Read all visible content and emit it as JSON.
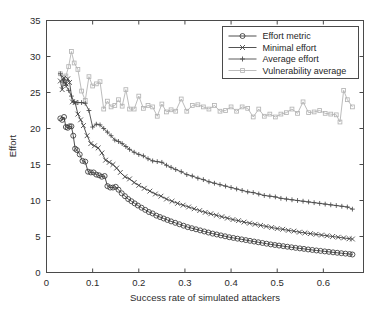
{
  "chart_data": {
    "type": "line",
    "title": "",
    "xlabel": "Success rate of simulated attackers",
    "ylabel": "Effort",
    "xlim": [
      0,
      0.687
    ],
    "ylim": [
      0,
      35
    ],
    "grid": false,
    "legend_position": "top-right",
    "xticks": [
      0,
      0.1,
      0.2,
      0.3,
      0.4,
      0.5,
      0.6
    ],
    "xtick_labels": [
      "0",
      "0.1",
      "0.2",
      "0.3",
      "0.4",
      "0.5",
      "0.6"
    ],
    "yticks": [
      0,
      5,
      10,
      15,
      20,
      25,
      30,
      35
    ],
    "ytick_labels": [
      "0",
      "5",
      "10",
      "15",
      "20",
      "25",
      "30",
      "35"
    ],
    "series": [
      {
        "name": "Effort metric",
        "marker": "circle",
        "color": "#3a3a3a",
        "x": [
          0.03,
          0.034,
          0.038,
          0.042,
          0.046,
          0.05,
          0.054,
          0.058,
          0.062,
          0.066,
          0.072,
          0.078,
          0.084,
          0.09,
          0.096,
          0.102,
          0.108,
          0.114,
          0.12,
          0.126,
          0.132,
          0.138,
          0.144,
          0.15,
          0.156,
          0.163,
          0.17,
          0.177,
          0.184,
          0.191,
          0.198,
          0.206,
          0.214,
          0.222,
          0.23,
          0.238,
          0.246,
          0.254,
          0.262,
          0.27,
          0.279,
          0.288,
          0.297,
          0.306,
          0.315,
          0.324,
          0.333,
          0.342,
          0.351,
          0.36,
          0.369,
          0.378,
          0.387,
          0.396,
          0.405,
          0.414,
          0.423,
          0.432,
          0.441,
          0.45,
          0.459,
          0.468,
          0.477,
          0.486,
          0.495,
          0.504,
          0.513,
          0.522,
          0.531,
          0.54,
          0.549,
          0.558,
          0.567,
          0.576,
          0.585,
          0.594,
          0.603,
          0.612,
          0.621,
          0.63,
          0.639,
          0.648,
          0.657,
          0.663
        ],
        "y": [
          21.4,
          21.2,
          21.6,
          20.2,
          20.1,
          20.3,
          20.3,
          19.0,
          17.2,
          17.0,
          16.4,
          15.5,
          15.4,
          14.0,
          13.9,
          13.9,
          13.6,
          13.5,
          13.3,
          13.4,
          12.0,
          11.8,
          11.8,
          11.9,
          11.5,
          11.0,
          10.6,
          10.2,
          9.9,
          9.6,
          9.3,
          9.0,
          8.7,
          8.4,
          8.2,
          7.9,
          7.7,
          7.5,
          7.3,
          7.1,
          6.9,
          6.7,
          6.5,
          6.3,
          6.15,
          6.0,
          5.85,
          5.7,
          5.55,
          5.4,
          5.28,
          5.15,
          5.03,
          4.9,
          4.8,
          4.7,
          4.6,
          4.5,
          4.4,
          4.3,
          4.2,
          4.1,
          4.0,
          3.9,
          3.82,
          3.74,
          3.66,
          3.58,
          3.5,
          3.42,
          3.35,
          3.28,
          3.2,
          3.13,
          3.06,
          3.0,
          2.93,
          2.87,
          2.8,
          2.74,
          2.68,
          2.62,
          2.56,
          2.5
        ]
      },
      {
        "name": "Minimal effort",
        "marker": "x",
        "color": "#3f3f3f",
        "x": [
          0.03,
          0.034,
          0.038,
          0.042,
          0.046,
          0.05,
          0.056,
          0.062,
          0.068,
          0.074,
          0.08,
          0.088,
          0.096,
          0.104,
          0.112,
          0.12,
          0.128,
          0.136,
          0.144,
          0.152,
          0.16,
          0.17,
          0.18,
          0.19,
          0.2,
          0.212,
          0.224,
          0.236,
          0.248,
          0.26,
          0.272,
          0.284,
          0.296,
          0.308,
          0.32,
          0.332,
          0.344,
          0.356,
          0.368,
          0.38,
          0.392,
          0.404,
          0.416,
          0.428,
          0.44,
          0.452,
          0.464,
          0.476,
          0.488,
          0.5,
          0.512,
          0.524,
          0.536,
          0.548,
          0.56,
          0.572,
          0.584,
          0.596,
          0.608,
          0.62,
          0.632,
          0.644,
          0.656,
          0.663
        ],
        "y": [
          26.6,
          25.4,
          27.0,
          26.2,
          26.9,
          26.4,
          23.7,
          23.6,
          22.0,
          21.2,
          20.4,
          19.0,
          17.9,
          17.6,
          17.3,
          16.6,
          15.6,
          15.3,
          15.0,
          14.5,
          13.9,
          13.3,
          13.0,
          12.5,
          12.1,
          11.7,
          11.3,
          10.9,
          10.6,
          10.2,
          9.9,
          9.6,
          9.35,
          9.1,
          8.85,
          8.6,
          8.35,
          8.15,
          7.95,
          7.75,
          7.55,
          7.35,
          7.2,
          7.0,
          6.85,
          6.7,
          6.55,
          6.4,
          6.25,
          6.1,
          6.0,
          5.85,
          5.75,
          5.6,
          5.5,
          5.4,
          5.3,
          5.2,
          5.1,
          5.0,
          4.9,
          4.8,
          4.7,
          4.65
        ]
      },
      {
        "name": "Average effort",
        "marker": "plus",
        "color": "#4a4a4a",
        "x": [
          0.03,
          0.036,
          0.042,
          0.048,
          0.054,
          0.06,
          0.068,
          0.076,
          0.084,
          0.092,
          0.1,
          0.108,
          0.116,
          0.124,
          0.132,
          0.14,
          0.148,
          0.156,
          0.164,
          0.172,
          0.18,
          0.19,
          0.2,
          0.21,
          0.22,
          0.23,
          0.24,
          0.25,
          0.26,
          0.27,
          0.28,
          0.292,
          0.304,
          0.316,
          0.328,
          0.34,
          0.352,
          0.364,
          0.376,
          0.388,
          0.4,
          0.412,
          0.424,
          0.436,
          0.448,
          0.46,
          0.472,
          0.484,
          0.496,
          0.508,
          0.52,
          0.532,
          0.544,
          0.556,
          0.568,
          0.58,
          0.592,
          0.604,
          0.616,
          0.628,
          0.64,
          0.652,
          0.663
        ],
        "y": [
          27.6,
          26.6,
          26.0,
          25.3,
          24.5,
          23.7,
          23.6,
          23.6,
          23.5,
          22.5,
          20.2,
          20.6,
          20.5,
          20.0,
          19.5,
          19.0,
          18.4,
          18.2,
          17.9,
          17.5,
          17.1,
          16.7,
          16.4,
          16.2,
          15.8,
          15.5,
          15.4,
          15.3,
          14.9,
          14.6,
          14.3,
          14.0,
          13.6,
          13.4,
          13.1,
          12.9,
          12.6,
          12.4,
          12.2,
          12.0,
          11.8,
          11.6,
          11.4,
          11.2,
          11.1,
          10.9,
          10.7,
          10.6,
          10.5,
          10.3,
          10.2,
          10.1,
          10.0,
          9.9,
          9.8,
          9.7,
          9.6,
          9.5,
          9.4,
          9.3,
          9.2,
          9.1,
          8.8
        ]
      },
      {
        "name": "Vulnerability average",
        "marker": "square",
        "color": "#b4b4b4",
        "x": [
          0.03,
          0.036,
          0.042,
          0.048,
          0.054,
          0.06,
          0.068,
          0.076,
          0.084,
          0.092,
          0.1,
          0.108,
          0.116,
          0.124,
          0.132,
          0.14,
          0.148,
          0.156,
          0.164,
          0.172,
          0.18,
          0.19,
          0.2,
          0.21,
          0.22,
          0.23,
          0.24,
          0.25,
          0.26,
          0.27,
          0.28,
          0.292,
          0.304,
          0.316,
          0.328,
          0.34,
          0.352,
          0.364,
          0.376,
          0.388,
          0.4,
          0.412,
          0.424,
          0.436,
          0.448,
          0.46,
          0.472,
          0.484,
          0.496,
          0.508,
          0.52,
          0.532,
          0.544,
          0.556,
          0.568,
          0.58,
          0.592,
          0.604,
          0.616,
          0.628,
          0.636,
          0.644,
          0.652,
          0.663
        ],
        "y": [
          27.6,
          27.1,
          27.3,
          28.6,
          30.7,
          29.1,
          28.2,
          25.2,
          23.9,
          27.2,
          25.9,
          26.2,
          26.5,
          22.7,
          23.8,
          23.0,
          23.2,
          24.0,
          23.1,
          25.4,
          22.7,
          22.7,
          24.5,
          22.8,
          23.2,
          23.0,
          21.7,
          23.4,
          22.3,
          22.6,
          22.4,
          24.1,
          22.4,
          23.2,
          23.3,
          23.0,
          22.7,
          23.2,
          22.4,
          22.5,
          23.0,
          22.4,
          23.0,
          22.8,
          21.6,
          22.7,
          21.7,
          22.0,
          21.6,
          22.0,
          22.2,
          22.7,
          22.1,
          23.7,
          22.2,
          22.3,
          22.5,
          22.1,
          22.0,
          21.9,
          20.9,
          25.3,
          24.0,
          23.0
        ]
      }
    ]
  },
  "legend": {
    "items": [
      {
        "label": "Effort metric",
        "marker": "circle",
        "color": "#3a3a3a"
      },
      {
        "label": "Minimal effort",
        "marker": "x",
        "color": "#3f3f3f"
      },
      {
        "label": "Average effort",
        "marker": "plus",
        "color": "#4a4a4a"
      },
      {
        "label": "Vulnerability average",
        "marker": "square",
        "color": "#b4b4b4"
      }
    ]
  },
  "colors": {
    "axis": "#4a4a4a",
    "text": "#2b2b2b",
    "background": "#ffffff"
  }
}
